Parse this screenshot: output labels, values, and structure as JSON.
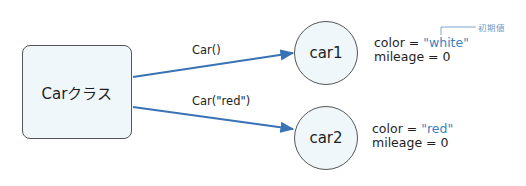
{
  "class_node": {
    "label": "Carクラス"
  },
  "edges": [
    {
      "label": "Car()",
      "from": "Carクラス",
      "to": "car1"
    },
    {
      "label": "Car(\"red\")",
      "from": "Carクラス",
      "to": "car2"
    }
  ],
  "instances": [
    {
      "name": "car1",
      "attributes": [
        {
          "key": "color",
          "op": "=",
          "value": "\"white\""
        },
        {
          "key": "mileage",
          "op": "=",
          "value": "0"
        }
      ]
    },
    {
      "name": "car2",
      "attributes": [
        {
          "key": "color",
          "op": "=",
          "value": "\"red\""
        },
        {
          "key": "mileage",
          "op": "=",
          "value": "0"
        }
      ]
    }
  ],
  "annotation": {
    "label": "初期値",
    "target": "\"white\""
  },
  "colors": {
    "arrow": "#3a73b5",
    "node_fill": "#eff7fb",
    "node_border": "#555555",
    "value_text": "#3d7fc2",
    "annotation": "#6d9bc7"
  }
}
